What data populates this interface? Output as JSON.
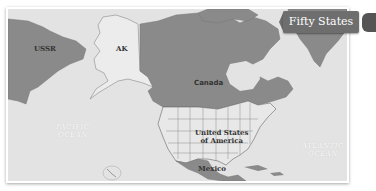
{
  "title": "Fifty States",
  "map": {
    "regions": {
      "ussr": "USSR",
      "alaska": "AK",
      "canada": "Canada",
      "usa_line1": "United States",
      "usa_line2": "of America",
      "mexico": "Mexico",
      "hawaii": "HI"
    },
    "oceans": {
      "pacific_line1": "PACIFIC",
      "pacific_line2": "OCEAN",
      "atlantic_line1": "ATLANTIC",
      "atlantic_line2": "OCEAN"
    },
    "colors": {
      "water": "#e3e3e3",
      "land_other": "#8a8a8a",
      "land_us": "#e8e8e8",
      "ribbon": "#6e6e6e"
    }
  }
}
